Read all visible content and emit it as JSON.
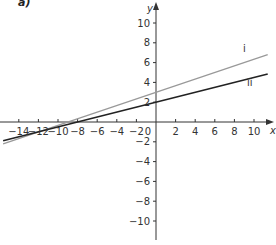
{
  "part_label": "a)",
  "chart_data": {
    "type": "line",
    "title": "",
    "xlabel": "x",
    "ylabel": "y",
    "xlim": [
      -15.6,
      12
    ],
    "ylim": [
      -12,
      11.5
    ],
    "grid": false,
    "x_ticks": [
      -14,
      -12,
      -10,
      -8,
      -6,
      -4,
      -2,
      2,
      4,
      6,
      8,
      10
    ],
    "y_ticks": [
      -10,
      -8,
      -6,
      -4,
      -2,
      2,
      4,
      6,
      8,
      10
    ],
    "origin_label": "0",
    "series": [
      {
        "name": "i",
        "color": "#999999",
        "x": [
          -15.6,
          11.4
        ],
        "y": [
          -2.2,
          6.8
        ],
        "equation": "y = x/3 + 3"
      },
      {
        "name": "ii",
        "color": "#222222",
        "x": [
          -15.6,
          11.4
        ],
        "y": [
          -1.9,
          4.85
        ],
        "equation": "y = x/4 + 2"
      }
    ],
    "legend": "labels placed at right end of lines"
  }
}
